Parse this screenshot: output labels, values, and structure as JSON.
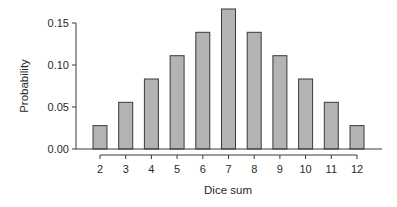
{
  "chart_data": {
    "type": "bar",
    "title": "",
    "xlabel": "Dice sum",
    "ylabel": "Probability",
    "categories": [
      "2",
      "3",
      "4",
      "5",
      "6",
      "7",
      "8",
      "9",
      "10",
      "11",
      "12"
    ],
    "values": [
      0.0278,
      0.0556,
      0.0833,
      0.1111,
      0.1389,
      0.1667,
      0.1389,
      0.1111,
      0.0833,
      0.0556,
      0.0278
    ],
    "ylim": [
      0,
      0.15
    ],
    "yticks": [
      "0.00",
      "0.05",
      "0.10",
      "0.15"
    ],
    "ytick_values": [
      0,
      0.05,
      0.1,
      0.15
    ],
    "grid": false,
    "legend": null,
    "bar_color": "#b3b3b3",
    "edge_color": "#3a3a3a"
  }
}
